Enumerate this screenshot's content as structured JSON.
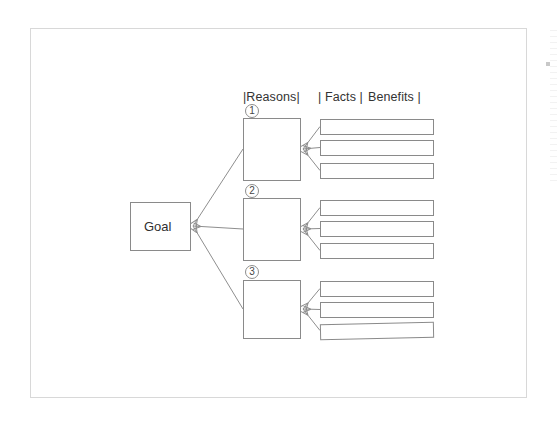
{
  "document": {
    "title": "Logic Tree Diagram",
    "sheet": {
      "x": 30,
      "y": 28,
      "width": 497,
      "height": 370,
      "border_color": "#d8d8d8",
      "background": "#ffffff"
    },
    "stroke_color": "#8a8a8a",
    "text_color": "#333333"
  },
  "headers": [
    {
      "id": "reasons",
      "label": "|Reasons|",
      "x": 243,
      "y": 91
    },
    {
      "id": "facts",
      "label": "| Facts |",
      "x": 318,
      "y": 91
    },
    {
      "id": "benefits",
      "label": "Benefits |",
      "x": 368,
      "y": 91
    }
  ],
  "goal": {
    "label": "Goal",
    "x": 130,
    "y": 202,
    "width": 60,
    "height": 48
  },
  "branches": [
    {
      "number": "①",
      "number_plain": "1",
      "marker_x": 245,
      "marker_y": 104,
      "box": {
        "x": 243,
        "y": 118,
        "width": 57,
        "height": 62
      },
      "label": "",
      "benefits": [
        {
          "label": "",
          "x": 320,
          "y": 119,
          "width": 113,
          "height": 15,
          "rotate": 0
        },
        {
          "label": "",
          "x": 320,
          "y": 140,
          "width": 113,
          "height": 15,
          "rotate": 0
        },
        {
          "label": "",
          "x": 320,
          "y": 163,
          "width": 113,
          "height": 15,
          "rotate": 0
        }
      ]
    },
    {
      "number": "②",
      "number_plain": "2",
      "marker_x": 245,
      "marker_y": 184,
      "box": {
        "x": 243,
        "y": 198,
        "width": 57,
        "height": 62
      },
      "label": "",
      "benefits": [
        {
          "label": "",
          "x": 320,
          "y": 200,
          "width": 113,
          "height": 15,
          "rotate": 0
        },
        {
          "label": "",
          "x": 320,
          "y": 221,
          "width": 113,
          "height": 15,
          "rotate": 0
        },
        {
          "label": "",
          "x": 320,
          "y": 243,
          "width": 113,
          "height": 15,
          "rotate": 0
        }
      ]
    },
    {
      "number": "③",
      "number_plain": "3",
      "marker_x": 245,
      "marker_y": 265,
      "box": {
        "x": 243,
        "y": 280,
        "width": 57,
        "height": 58
      },
      "label": "",
      "benefits": [
        {
          "label": "",
          "x": 320,
          "y": 281,
          "width": 113,
          "height": 15,
          "rotate": 0
        },
        {
          "label": "",
          "x": 320,
          "y": 302,
          "width": 113,
          "height": 15,
          "rotate": 0
        },
        {
          "label": "",
          "x": 320,
          "y": 323,
          "width": 113,
          "height": 15,
          "rotate": -1.2
        }
      ]
    }
  ],
  "chart_data": {
    "type": "diagram",
    "diagram_kind": "logic-tree",
    "columns": [
      "Reasons",
      "Facts",
      "Benefits"
    ],
    "root": "Goal",
    "nodes": [
      {
        "level": 0,
        "id": "goal",
        "label": "Goal"
      },
      {
        "level": 1,
        "id": "reason-1",
        "label": "",
        "marker": "1"
      },
      {
        "level": 1,
        "id": "reason-2",
        "label": "",
        "marker": "2"
      },
      {
        "level": 1,
        "id": "reason-3",
        "label": "",
        "marker": "3"
      },
      {
        "level": 2,
        "id": "benefit-1-1",
        "label": ""
      },
      {
        "level": 2,
        "id": "benefit-1-2",
        "label": ""
      },
      {
        "level": 2,
        "id": "benefit-1-3",
        "label": ""
      },
      {
        "level": 2,
        "id": "benefit-2-1",
        "label": ""
      },
      {
        "level": 2,
        "id": "benefit-2-2",
        "label": ""
      },
      {
        "level": 2,
        "id": "benefit-2-3",
        "label": ""
      },
      {
        "level": 2,
        "id": "benefit-3-1",
        "label": ""
      },
      {
        "level": 2,
        "id": "benefit-3-2",
        "label": ""
      },
      {
        "level": 2,
        "id": "benefit-3-3",
        "label": ""
      }
    ],
    "edges": [
      {
        "from": "reason-1",
        "to": "goal",
        "arrow": "to"
      },
      {
        "from": "reason-2",
        "to": "goal",
        "arrow": "to"
      },
      {
        "from": "reason-3",
        "to": "goal",
        "arrow": "to"
      },
      {
        "from": "benefit-1-1",
        "to": "reason-1",
        "arrow": "to"
      },
      {
        "from": "benefit-1-2",
        "to": "reason-1",
        "arrow": "to"
      },
      {
        "from": "benefit-1-3",
        "to": "reason-1",
        "arrow": "to"
      },
      {
        "from": "benefit-2-1",
        "to": "reason-2",
        "arrow": "to"
      },
      {
        "from": "benefit-2-2",
        "to": "reason-2",
        "arrow": "to"
      },
      {
        "from": "benefit-2-3",
        "to": "reason-2",
        "arrow": "to"
      },
      {
        "from": "benefit-3-1",
        "to": "reason-3",
        "arrow": "to"
      },
      {
        "from": "benefit-3-2",
        "to": "reason-3",
        "arrow": "to"
      },
      {
        "from": "benefit-3-3",
        "to": "reason-3",
        "arrow": "to"
      }
    ]
  }
}
